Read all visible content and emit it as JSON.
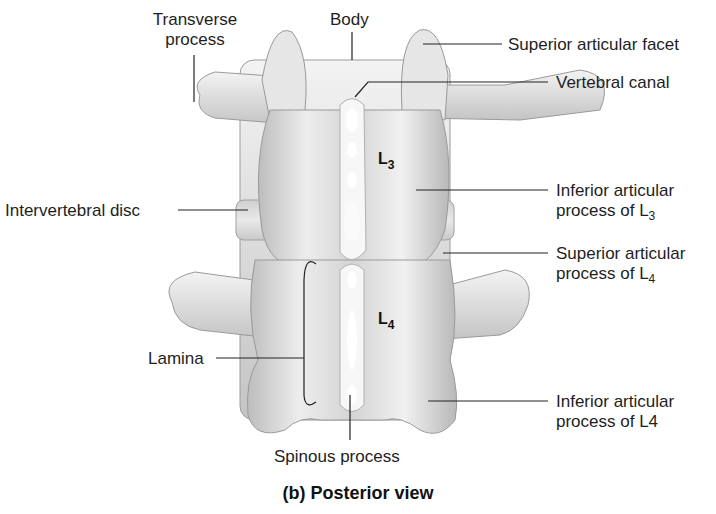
{
  "figure": {
    "caption": "(b) Posterior view",
    "vertebrae": [
      {
        "id": "L3",
        "letter": "L",
        "number": "3"
      },
      {
        "id": "L4",
        "letter": "L",
        "number": "4"
      }
    ],
    "labels": {
      "transverse_process_1": "Transverse",
      "transverse_process_2": "process",
      "body": "Body",
      "superior_articular_facet": "Superior articular facet",
      "vertebral_canal": "Vertebral canal",
      "intervertebral_disc": "Intervertebral disc",
      "inferior_articular_process_L3_1": "Inferior articular",
      "inferior_articular_process_L3_2": "process of L",
      "inferior_articular_process_L3_sub": "3",
      "superior_articular_process_L4_1": "Superior articular",
      "superior_articular_process_L4_2": "process of L",
      "superior_articular_process_L4_sub": "4",
      "lamina": "Lamina",
      "inferior_articular_process_L4_1": "Inferior articular",
      "inferior_articular_process_L4_2": "process of L4",
      "spinous_process": "Spinous process"
    },
    "colors": {
      "bone_light": "#f2f2f2",
      "bone_mid": "#d6d6d6",
      "bone_dark": "#a9a9a9",
      "leader_line": "#222222"
    }
  }
}
